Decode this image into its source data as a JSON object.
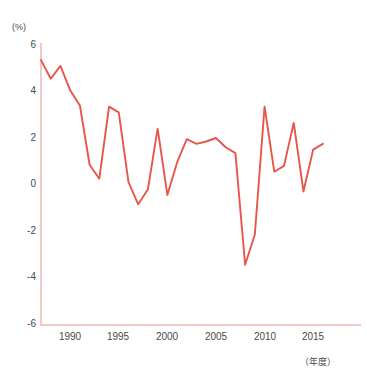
{
  "chart_data": {
    "type": "line",
    "title": "",
    "xlabel": "（年度）",
    "ylabel": "(%)",
    "ylim": [
      -6,
      6
    ],
    "xlim": [
      1988,
      2017
    ],
    "grid": false,
    "legend": null,
    "yticks": [
      6,
      4,
      2,
      0,
      -2,
      -4,
      -6
    ],
    "xticks": [
      1990,
      1995,
      2000,
      2005,
      2010,
      2015
    ],
    "ytick_labels": [
      "6",
      "4",
      "2",
      "0",
      "-2",
      "-4",
      "-6"
    ],
    "xtick_labels": [
      "1990",
      "1995",
      "2000",
      "2005",
      "2010",
      "2015"
    ],
    "series": [
      {
        "name": "伸び率",
        "color": "#e8554a",
        "x": [
          1988,
          1989,
          1990,
          1991,
          1992,
          1993,
          1994,
          1995,
          1996,
          1997,
          1998,
          1999,
          2000,
          2001,
          2002,
          2003,
          2004,
          2005,
          2006,
          2007,
          2008,
          2009,
          2010,
          2011,
          2012,
          2013,
          2014,
          2015,
          2016,
          2017
        ],
        "values": [
          5.35,
          4.55,
          5.1,
          4.05,
          3.4,
          0.85,
          0.25,
          3.35,
          3.1,
          0.1,
          -0.85,
          -0.2,
          2.4,
          -0.45,
          0.95,
          1.95,
          1.75,
          1.85,
          2.0,
          1.6,
          1.35,
          -3.45,
          -2.15,
          3.35,
          0.55,
          0.8,
          2.65,
          -0.3,
          1.5,
          1.75
        ]
      }
    ]
  },
  "axes": {
    "axis_color": "#f3c9c6",
    "text_color": "#4a4a4a"
  }
}
